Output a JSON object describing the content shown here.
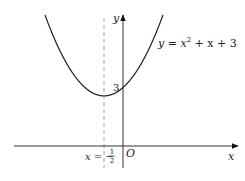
{
  "figure": {
    "type": "function-graph",
    "axes": {
      "x_label": "x",
      "y_label": "y",
      "origin_label": "O"
    },
    "curve": {
      "equation_lhs": "y = x",
      "equation_exp": "2",
      "equation_rhs": " + x + 3",
      "y_intercept_label": "3"
    },
    "axis_of_symmetry": {
      "label_prefix": "x = −",
      "frac_num": "1",
      "frac_den": "2"
    },
    "colors": {
      "ink": "#222222",
      "dashed": "#999999",
      "background": "#ffffff"
    }
  }
}
